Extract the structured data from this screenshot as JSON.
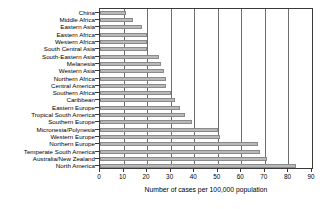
{
  "chart_data": {
    "type": "bar",
    "orientation": "horizontal",
    "title": "",
    "xlabel": "Number of cases per 100,000 population",
    "ylabel": "",
    "xlim": [
      0,
      90
    ],
    "ylim": null,
    "grid": true,
    "legend": null,
    "xticks": [
      0,
      10,
      20,
      30,
      40,
      50,
      60,
      70,
      80,
      90
    ],
    "xticklabels": [
      "0",
      "10",
      "20",
      "30",
      "40",
      "50",
      "60",
      "70",
      "80",
      "90"
    ],
    "categories": [
      "China",
      "Middle Africa",
      "Eastern Asia",
      "Eastern Africa",
      "Western Africa",
      "South Central Asia",
      "South-Eastern Asia",
      "Melanesia",
      "Western Asia",
      "Northern Africa",
      "Central America",
      "Southern Africa",
      "Caribbean",
      "Eastern Europe",
      "Tropical South America",
      "Southern Europe",
      "Micronesia/Polynesia",
      "Western Europe",
      "Northern Europe",
      "Temperate South America",
      "Australia/New Zealand",
      "North America"
    ],
    "values": [
      11.0,
      14.0,
      18.0,
      20.0,
      20.0,
      20.0,
      25.0,
      26.0,
      27.0,
      28.0,
      28.0,
      30.0,
      32.0,
      34.0,
      36.0,
      39.0,
      50.0,
      51.0,
      67.0,
      68.0,
      71.0,
      83.0
    ],
    "bar_color": "#b9b9b9",
    "bar_edge_color": "#8a8a8a",
    "axis_color": "#3a3a3a",
    "gridline_color": "#6e6e6e"
  }
}
